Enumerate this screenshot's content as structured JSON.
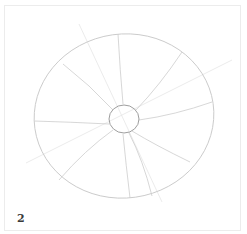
{
  "step": {
    "number": "2"
  },
  "drawing": {
    "subject": "pencil sketch: outer ellipse with small center circle and radiating spokes",
    "stroke_color": "#c4c4c4",
    "center_stroke_color": "#9a9a9a",
    "frame_color": "#ececec"
  }
}
